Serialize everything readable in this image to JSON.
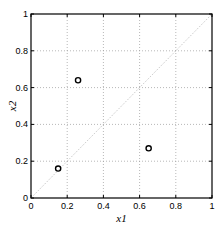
{
  "chart_data": {
    "type": "scatter",
    "title": "",
    "xlabel": "x1",
    "ylabel": "x2",
    "xlim": [
      0,
      1
    ],
    "ylim": [
      0,
      1
    ],
    "grid": true,
    "x_ticks": [
      "0",
      "0.2",
      "0.4",
      "0.6",
      "0.8",
      "1"
    ],
    "y_ticks": [
      "0",
      "0.2",
      "0.4",
      "0.6",
      "0.8",
      "1"
    ],
    "points": [
      {
        "x": 0.15,
        "y": 0.16
      },
      {
        "x": 0.26,
        "y": 0.64
      },
      {
        "x": 0.65,
        "y": 0.27
      }
    ],
    "reference_line": {
      "from": [
        0,
        0
      ],
      "to": [
        1,
        1
      ],
      "style": "dotted"
    }
  }
}
